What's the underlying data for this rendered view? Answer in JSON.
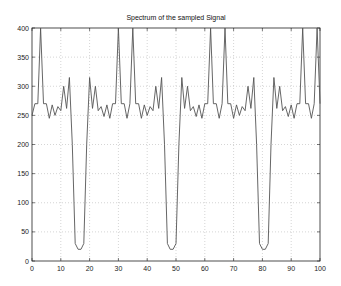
{
  "chart_data": {
    "type": "line",
    "title": "Spectrum of the sampled Signal",
    "xlabel": "",
    "ylabel": "",
    "xlim": [
      0,
      100
    ],
    "ylim": [
      0,
      400
    ],
    "grid": true,
    "legend": null,
    "xticks": [
      0,
      10,
      20,
      30,
      40,
      50,
      60,
      70,
      80,
      90,
      100
    ],
    "yticks": [
      0,
      50,
      100,
      150,
      200,
      250,
      300,
      350,
      400
    ],
    "x": [
      0,
      1,
      2,
      3,
      4,
      5,
      6,
      7,
      8,
      9,
      10,
      11,
      12,
      13,
      14,
      15,
      16,
      17,
      18,
      19,
      20,
      21,
      22,
      23,
      24,
      25,
      26,
      27,
      28,
      29,
      30,
      31,
      32,
      33,
      34,
      35,
      36,
      37,
      38,
      39,
      40,
      41,
      42,
      43,
      44,
      45,
      46,
      47,
      48,
      49,
      50,
      51,
      52,
      53,
      54,
      55,
      56,
      57,
      58,
      59,
      60,
      61,
      62,
      63,
      64,
      65,
      66,
      67,
      68,
      69,
      70,
      71,
      72,
      73,
      74,
      75,
      76,
      77,
      78,
      79,
      80,
      81,
      82,
      83,
      84,
      85,
      86,
      87,
      88,
      89,
      90,
      91,
      92,
      93,
      94,
      95,
      96,
      97,
      98,
      99,
      100
    ],
    "values": [
      250,
      270,
      270,
      400,
      270,
      270,
      245,
      268,
      250,
      265,
      258,
      300,
      262,
      315,
      200,
      30,
      20,
      20,
      30,
      200,
      315,
      262,
      300,
      258,
      265,
      248,
      268,
      245,
      270,
      270,
      400,
      270,
      270,
      245,
      270,
      400,
      270,
      270,
      245,
      268,
      250,
      265,
      258,
      300,
      262,
      315,
      200,
      30,
      20,
      20,
      30,
      200,
      315,
      262,
      300,
      258,
      265,
      248,
      268,
      245,
      270,
      270,
      400,
      270,
      270,
      245,
      270,
      400,
      270,
      270,
      245,
      268,
      250,
      265,
      258,
      300,
      262,
      315,
      200,
      30,
      20,
      20,
      30,
      200,
      315,
      262,
      300,
      258,
      265,
      248,
      268,
      245,
      270,
      270,
      400,
      270,
      270,
      245,
      270,
      400,
      270
    ]
  },
  "labels": {
    "title": "Spectrum of the sampled Signal",
    "x0": "0",
    "x10": "10",
    "x20": "20",
    "x30": "30",
    "x40": "40",
    "x50": "50",
    "x60": "60",
    "x70": "70",
    "x80": "80",
    "x90": "90",
    "x100": "100",
    "y0": "0",
    "y50": "50",
    "y100": "100",
    "y150": "150",
    "y200": "200",
    "y250": "250",
    "y300": "300",
    "y350": "350",
    "y400": "400"
  },
  "colors": {
    "line": "#555555",
    "axis": "#222222",
    "grid": "#aaaaaa"
  }
}
